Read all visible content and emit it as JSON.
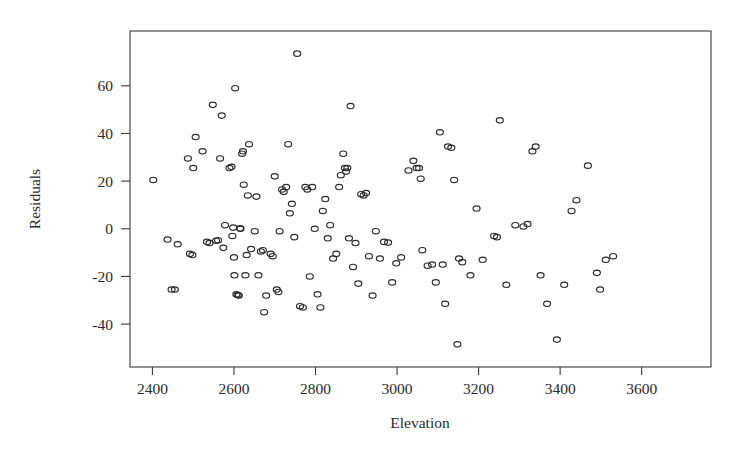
{
  "chart_data": {
    "type": "scatter",
    "title": "",
    "xlabel": "Elevation",
    "ylabel": "Residuals",
    "xlim": [
      2345,
      3770
    ],
    "ylim": [
      -58,
      83
    ],
    "grid": false,
    "legend": null,
    "marker": "open-circle",
    "xticks": [
      2400,
      2600,
      2800,
      3000,
      3200,
      3400,
      3600
    ],
    "yticks": [
      -40,
      -20,
      0,
      20,
      40,
      60
    ],
    "xtick_labels": [
      "2400",
      "2600",
      "2800",
      "3000",
      "3200",
      "3400",
      "3600"
    ],
    "ytick_labels": [
      "-40",
      "-20",
      "0",
      "20",
      "40",
      "60"
    ],
    "n_points": 135,
    "points": [
      [
        2402,
        20.5
      ],
      [
        2437,
        -4.5
      ],
      [
        2447,
        -25.5
      ],
      [
        2455,
        -25.5
      ],
      [
        2462,
        -6.5
      ],
      [
        2487,
        29.5
      ],
      [
        2492,
        -10.5
      ],
      [
        2498,
        -11.0
      ],
      [
        2500,
        25.5
      ],
      [
        2506,
        38.5
      ],
      [
        2523,
        32.5
      ],
      [
        2534,
        -5.5
      ],
      [
        2540,
        -6.0
      ],
      [
        2548,
        52.0
      ],
      [
        2556,
        -5.0
      ],
      [
        2561,
        -4.8
      ],
      [
        2566,
        29.5
      ],
      [
        2570,
        47.5
      ],
      [
        2574,
        -8.0
      ],
      [
        2578,
        1.5
      ],
      [
        2589,
        25.5
      ],
      [
        2594,
        26.0
      ],
      [
        2596,
        -3.0
      ],
      [
        2598,
        0.5
      ],
      [
        2600,
        -12.0
      ],
      [
        2601,
        -19.5
      ],
      [
        2603,
        59.0
      ],
      [
        2606,
        -27.5
      ],
      [
        2609,
        -27.8
      ],
      [
        2612,
        -28.0
      ],
      [
        2615,
        0.2
      ],
      [
        2616,
        0.0
      ],
      [
        2620,
        31.5
      ],
      [
        2622,
        32.5
      ],
      [
        2624,
        18.5
      ],
      [
        2628,
        -19.5
      ],
      [
        2631,
        -11.0
      ],
      [
        2634,
        14.0
      ],
      [
        2637,
        35.5
      ],
      [
        2642,
        -8.5
      ],
      [
        2651,
        -1.0
      ],
      [
        2655,
        13.5
      ],
      [
        2660,
        -19.5
      ],
      [
        2666,
        -9.5
      ],
      [
        2671,
        -9.0
      ],
      [
        2674,
        -35.0
      ],
      [
        2679,
        -28.0
      ],
      [
        2690,
        -10.5
      ],
      [
        2695,
        -11.5
      ],
      [
        2700,
        22.0
      ],
      [
        2705,
        -25.5
      ],
      [
        2709,
        -26.5
      ],
      [
        2712,
        -1.0
      ],
      [
        2718,
        16.5
      ],
      [
        2722,
        15.5
      ],
      [
        2728,
        17.5
      ],
      [
        2733,
        35.5
      ],
      [
        2737,
        6.5
      ],
      [
        2742,
        10.5
      ],
      [
        2748,
        -3.5
      ],
      [
        2755,
        73.5
      ],
      [
        2762,
        -32.5
      ],
      [
        2769,
        -33.0
      ],
      [
        2775,
        17.5
      ],
      [
        2780,
        16.5
      ],
      [
        2786,
        -20.0
      ],
      [
        2792,
        17.5
      ],
      [
        2798,
        0.0
      ],
      [
        2805,
        -27.5
      ],
      [
        2812,
        -33.0
      ],
      [
        2818,
        7.5
      ],
      [
        2824,
        12.5
      ],
      [
        2830,
        -4.0
      ],
      [
        2836,
        1.5
      ],
      [
        2843,
        -12.5
      ],
      [
        2851,
        -10.5
      ],
      [
        2858,
        17.5
      ],
      [
        2862,
        22.5
      ],
      [
        2868,
        31.5
      ],
      [
        2872,
        25.5
      ],
      [
        2875,
        24.0
      ],
      [
        2878,
        25.5
      ],
      [
        2882,
        -4.0
      ],
      [
        2886,
        51.5
      ],
      [
        2892,
        -16.0
      ],
      [
        2898,
        -6.0
      ],
      [
        2905,
        -23.0
      ],
      [
        2912,
        14.5
      ],
      [
        2918,
        14.0
      ],
      [
        2924,
        15.0
      ],
      [
        2931,
        -11.5
      ],
      [
        2940,
        -28.0
      ],
      [
        2948,
        -1.0
      ],
      [
        2958,
        -12.5
      ],
      [
        2968,
        -5.5
      ],
      [
        2978,
        -5.8
      ],
      [
        2988,
        -22.5
      ],
      [
        2998,
        -14.5
      ],
      [
        3010,
        -12.0
      ],
      [
        3028,
        24.5
      ],
      [
        3040,
        28.5
      ],
      [
        3048,
        25.5
      ],
      [
        3054,
        25.5
      ],
      [
        3058,
        21.0
      ],
      [
        3062,
        -9.0
      ],
      [
        3075,
        -15.5
      ],
      [
        3086,
        -15.0
      ],
      [
        3095,
        -22.5
      ],
      [
        3105,
        40.5
      ],
      [
        3112,
        -15.0
      ],
      [
        3118,
        -31.5
      ],
      [
        3125,
        34.5
      ],
      [
        3133,
        34.0
      ],
      [
        3140,
        20.5
      ],
      [
        3148,
        -48.5
      ],
      [
        3152,
        -12.5
      ],
      [
        3160,
        -14.0
      ],
      [
        3180,
        -19.5
      ],
      [
        3195,
        8.5
      ],
      [
        3210,
        -13.0
      ],
      [
        3238,
        -3.0
      ],
      [
        3245,
        -3.5
      ],
      [
        3252,
        45.5
      ],
      [
        3268,
        -23.5
      ],
      [
        3290,
        1.5
      ],
      [
        3310,
        1.0
      ],
      [
        3320,
        2.0
      ],
      [
        3332,
        32.5
      ],
      [
        3340,
        34.5
      ],
      [
        3352,
        -19.5
      ],
      [
        3368,
        -31.5
      ],
      [
        3392,
        -46.5
      ],
      [
        3410,
        -23.5
      ],
      [
        3428,
        7.5
      ],
      [
        3440,
        12.0
      ],
      [
        3468,
        26.5
      ],
      [
        3490,
        -18.5
      ],
      [
        3498,
        -25.5
      ],
      [
        3512,
        -13.0
      ],
      [
        3530,
        -11.5
      ]
    ]
  },
  "figure": {
    "plot_frame": {
      "left": 130,
      "top": 31,
      "right": 711,
      "bottom": 367
    },
    "colors": {
      "axis": "#3a3a3a",
      "marker_stroke": "#2b2b2b",
      "background": "#ffffff"
    }
  }
}
